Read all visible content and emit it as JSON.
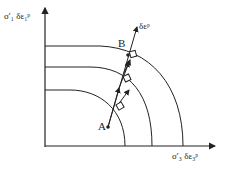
{
  "diagram": {
    "y_axis_label": "σ′₁ δε₁ᵖ",
    "x_axis_label": "σ′₃ δε₃ᵖ",
    "strain_increment_label": "δεᵖ",
    "point_a_label": "A",
    "point_b_label": "B",
    "yield_surfaces": 3,
    "colors": {
      "line": "#222222",
      "background": "#ffffff"
    }
  }
}
